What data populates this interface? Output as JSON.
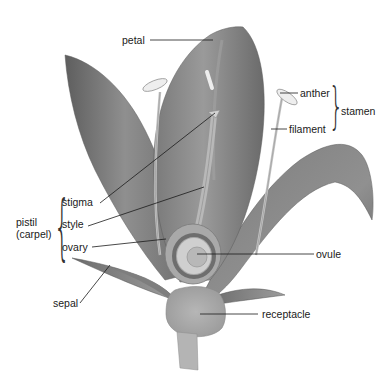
{
  "diagram": {
    "labels": {
      "petal": "petal",
      "anther": "anther",
      "filament": "filament",
      "stamen": "stamen",
      "stigma": "stigma",
      "style": "style",
      "ovary": "ovary",
      "pistil_line1": "pistil",
      "pistil_line2": "(carpel)",
      "ovule": "ovule",
      "sepal": "sepal",
      "receptacle": "receptacle"
    },
    "groups": [
      {
        "name": "stamen",
        "members": [
          "anther",
          "filament"
        ]
      },
      {
        "name": "pistil (carpel)",
        "members": [
          "stigma",
          "style",
          "ovary"
        ]
      }
    ],
    "colors": {
      "petal_dark": "#6e6e6e",
      "petal_mid": "#8c8c8c",
      "petal_light": "#a9a9a9",
      "stem": "#b4b4b4",
      "anther": "#e6e6e6",
      "leader_line": "#1a1a1a"
    }
  }
}
